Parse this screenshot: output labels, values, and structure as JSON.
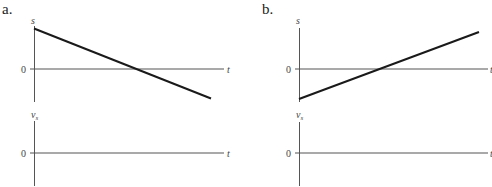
{
  "figure": {
    "panels": [
      {
        "label": "a.",
        "position_graph": {
          "y_axis_label": "s",
          "x_axis_label": "t",
          "zero_label": "0",
          "line": {
            "description": "decreasing straight line starting positive, crossing zero, ending negative"
          }
        },
        "velocity_graph": {
          "y_axis_label": "v",
          "y_axis_subscript": "s",
          "x_axis_label": "t",
          "zero_label": "0"
        }
      },
      {
        "label": "b.",
        "position_graph": {
          "y_axis_label": "s",
          "x_axis_label": "t",
          "zero_label": "0",
          "line": {
            "description": "increasing straight line starting negative, crossing zero, ending positive"
          }
        },
        "velocity_graph": {
          "y_axis_label": "v",
          "y_axis_subscript": "s",
          "x_axis_label": "t",
          "zero_label": "0"
        }
      }
    ]
  }
}
